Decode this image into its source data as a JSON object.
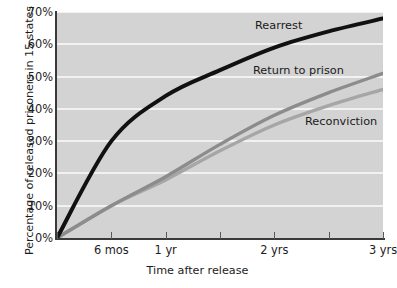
{
  "chart_data": {
    "type": "line",
    "title": "",
    "xlabel": "Time after release",
    "ylabel": "Percentage of released prisoners in 15 states",
    "x": [
      0,
      6,
      12,
      18,
      24,
      30,
      36
    ],
    "x_unit": "months after release",
    "xtick_labels": [
      "",
      "6 mos",
      "1 yr",
      "",
      "2 yrs",
      "",
      "3 yrs"
    ],
    "xtick_values": [
      0,
      6,
      12,
      18,
      24,
      30,
      36
    ],
    "ytick_labels": [
      "0%",
      "10%",
      "20%",
      "30%",
      "40%",
      "50%",
      "60%",
      "70%"
    ],
    "ytick_values": [
      0,
      10,
      20,
      30,
      40,
      50,
      60,
      70
    ],
    "ylim": [
      0,
      70
    ],
    "xlim": [
      0,
      36
    ],
    "grid": "horizontal",
    "legend_position": "inline-annotations",
    "plot_background": "#d3d3d3",
    "gridline_color": "#f2f2f2",
    "series": [
      {
        "name": "Rearrest",
        "color": "#111111",
        "values": [
          0,
          30,
          44,
          52,
          59,
          64,
          68
        ],
        "label_position": "upper-right"
      },
      {
        "name": "Return to prison",
        "color": "#8c8c8c",
        "values": [
          0,
          10,
          19,
          29,
          38,
          45,
          51
        ],
        "label_position": "middle-right"
      },
      {
        "name": "Reconviction",
        "color": "#a6a6a6",
        "values": [
          0,
          10,
          18,
          27,
          35,
          41,
          46
        ],
        "label_position": "lower-right"
      }
    ]
  }
}
